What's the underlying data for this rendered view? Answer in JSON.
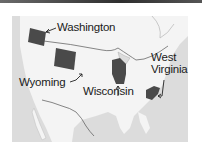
{
  "map": {
    "title": "",
    "region": "United States",
    "highlight_color": "#4a4a4a",
    "land_color": "#f4f4f4",
    "water_color": "#dcdcdc",
    "states": [
      {
        "name": "Washington",
        "label": "Washington"
      },
      {
        "name": "Wyoming",
        "label": "Wyoming"
      },
      {
        "name": "Wisconsin",
        "label": "Wisconsin"
      },
      {
        "name": "West Virginia",
        "label_line1": "West",
        "label_line2": "Virginia"
      }
    ]
  }
}
